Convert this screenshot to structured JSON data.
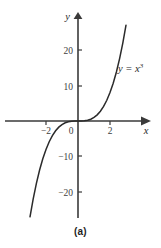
{
  "figure": {
    "caption": "(a)",
    "curve_label": "y = x",
    "curve_exponent": "3",
    "x_axis_name": "x",
    "y_axis_name": "y"
  },
  "chart_data": {
    "type": "line",
    "title": "",
    "subtitle": "",
    "xlabel": "x",
    "ylabel": "y",
    "legend": [
      "y = x^3"
    ],
    "legend_position": "inline-right",
    "annotations": [
      {
        "text": "y = x^3",
        "x": 2.6,
        "y": 15
      }
    ],
    "grid": false,
    "axis_style": "arrow-tipped-cross",
    "xlim": [
      -3.3,
      3.5
    ],
    "ylim": [
      -27,
      27
    ],
    "xticks": [
      -2,
      0,
      2
    ],
    "xtick_labels": [
      "−2",
      "0",
      "2"
    ],
    "yticks": [
      -20,
      -10,
      10,
      20
    ],
    "ytick_labels": [
      "−20",
      "−10",
      "10",
      "20"
    ],
    "series": [
      {
        "name": "y = x^3",
        "equation": "y = x^3",
        "x": [
          -3.0,
          -2.8,
          -2.6,
          -2.4,
          -2.2,
          -2.0,
          -1.8,
          -1.6,
          -1.4,
          -1.2,
          -1.0,
          -0.8,
          -0.6,
          -0.4,
          -0.2,
          0.0,
          0.2,
          0.4,
          0.6,
          0.8,
          1.0,
          1.2,
          1.4,
          1.6,
          1.8,
          2.0,
          2.2,
          2.4,
          2.6,
          2.8,
          3.0
        ],
        "values": [
          -27.0,
          -21.95,
          -17.58,
          -13.82,
          -10.65,
          -8.0,
          -5.83,
          -4.1,
          -2.74,
          -1.73,
          -1.0,
          -0.51,
          -0.22,
          -0.06,
          -0.01,
          0.0,
          0.01,
          0.06,
          0.22,
          0.51,
          1.0,
          1.73,
          2.74,
          4.1,
          5.83,
          8.0,
          10.65,
          13.82,
          17.58,
          21.95,
          27.0
        ]
      }
    ]
  }
}
